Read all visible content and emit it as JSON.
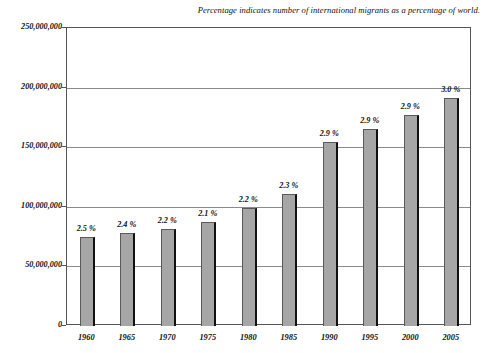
{
  "chart_data": {
    "type": "bar",
    "title": "",
    "annotation": "Percentage indicates number of international migrants as a percentage of world.",
    "categories": [
      "1960",
      "1965",
      "1970",
      "1975",
      "1980",
      "1985",
      "1990",
      "1995",
      "2000",
      "2005"
    ],
    "values": [
      75000000,
      78000000,
      81000000,
      87000000,
      99000000,
      111000000,
      154000000,
      165000000,
      177000000,
      191000000
    ],
    "data_labels": [
      "2.5 %",
      "2.4 %",
      "2.2 %",
      "2.1 %",
      "2.2 %",
      "2.3 %",
      "2.9 %",
      "2.9 %",
      "2.9 %",
      "3.0 %"
    ],
    "xlabel": "",
    "ylabel": "",
    "ylim": [
      0,
      250000000
    ],
    "ytick_values": [
      0,
      50000000,
      100000000,
      150000000,
      200000000,
      250000000
    ],
    "ytick_labels": [
      "0",
      "50,000,000",
      "100,000,000",
      "150,000,000",
      "200,000,000",
      "250,000,000"
    ],
    "grid": true,
    "legend": false,
    "series_color": "#a6a6a6",
    "grid_color": "#8a8a8a",
    "frame_color": "#555555"
  }
}
